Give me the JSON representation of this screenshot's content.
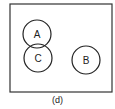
{
  "diagram": {
    "caption": "(d)",
    "frame": {
      "x": 10,
      "y": 4,
      "width": 102,
      "height": 88,
      "stroke": "#333333"
    },
    "circles": [
      {
        "label": "A",
        "cx": 37,
        "cy": 34,
        "r": 14
      },
      {
        "label": "C",
        "cx": 38,
        "cy": 58,
        "r": 14
      },
      {
        "label": "B",
        "cx": 86,
        "cy": 60,
        "r": 14
      }
    ]
  }
}
